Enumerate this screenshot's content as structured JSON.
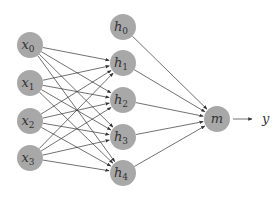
{
  "diagram": {
    "input_nodes": [
      {
        "id": "x0",
        "base": "x",
        "sub": "0"
      },
      {
        "id": "x1",
        "base": "x",
        "sub": "1"
      },
      {
        "id": "x2",
        "base": "x",
        "sub": "2"
      },
      {
        "id": "x3",
        "base": "x",
        "sub": "3"
      }
    ],
    "hidden_nodes": [
      {
        "id": "h0",
        "base": "h",
        "sub": "0"
      },
      {
        "id": "h1",
        "base": "h",
        "sub": "1"
      },
      {
        "id": "h2",
        "base": "h",
        "sub": "2"
      },
      {
        "id": "h3",
        "base": "h",
        "sub": "3"
      },
      {
        "id": "h4",
        "base": "h",
        "sub": "4"
      }
    ],
    "output_node": {
      "id": "m",
      "base": "m",
      "sub": ""
    },
    "output_label": "y",
    "edges_input_to_hidden": "all inputs connect to h1..h4 (h0 is bias, no incoming)",
    "edges_hidden_to_output": "all hidden nodes connect to m",
    "colors": {
      "node": "#a8a8a8",
      "edge": "#333333",
      "text": "#333333"
    }
  }
}
